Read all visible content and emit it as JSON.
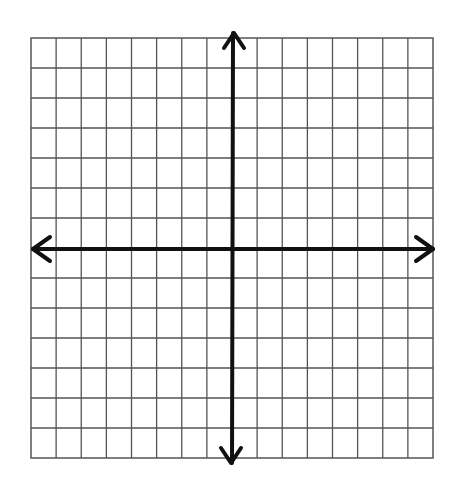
{
  "diagram": {
    "type": "coordinate-plane-grid",
    "grid": {
      "columns": 16,
      "rows": 14,
      "columns_left_of_y_axis": 8,
      "columns_right_of_y_axis": 8,
      "rows_above_x_axis": 7,
      "rows_below_x_axis": 7,
      "line_color": "#555555",
      "axis_color": "#111111",
      "background": "#ffffff"
    },
    "axes": {
      "x_axis": {
        "arrows": [
          "left",
          "right"
        ],
        "labels": []
      },
      "y_axis": {
        "arrows": [
          "up",
          "down"
        ],
        "labels": []
      }
    },
    "tick_labels": []
  }
}
